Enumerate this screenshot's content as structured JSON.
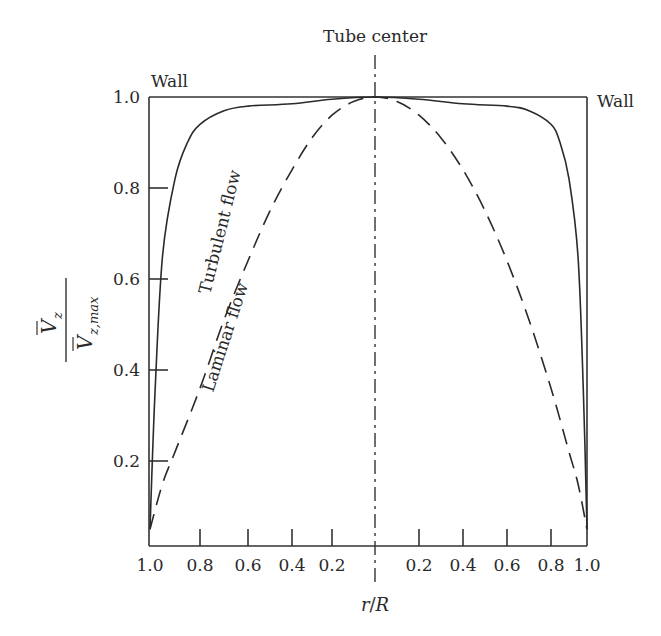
{
  "chart_data": {
    "type": "line",
    "title": "",
    "xlabel": "r/R",
    "ylabel": "V̄z / V̄z,max",
    "ylabel_numerator": "V",
    "ylabel_numerator_sub": "z",
    "ylabel_denominator": "V",
    "ylabel_denominator_sub": "z,max",
    "x_tick_labels_left": [
      "1.0",
      "0.8",
      "0.6",
      "0.4",
      "0.2"
    ],
    "x_tick_labels_right": [
      "0.2",
      "0.4",
      "0.6",
      "0.8",
      "1.0"
    ],
    "y_tick_labels": [
      "0.2",
      "0.4",
      "0.6",
      "0.8",
      "1.0"
    ],
    "ylim": [
      0,
      1.0
    ],
    "xlim_description": "symmetric about tube center: r/R from 1.0 (wall) to 0 (center) to 1.0 (wall)",
    "grid": false,
    "annotations": {
      "center_label": "Tube center",
      "wall_left": "Wall",
      "wall_right": "Wall"
    },
    "series": [
      {
        "name": "Turbulent flow",
        "style": "solid",
        "r_over_R": [
          1.0,
          0.98,
          0.95,
          0.9,
          0.85,
          0.8,
          0.7,
          0.6,
          0.4,
          0.2,
          0.0
        ],
        "values": [
          0.05,
          0.35,
          0.65,
          0.82,
          0.9,
          0.94,
          0.97,
          0.98,
          0.985,
          0.995,
          1.0
        ]
      },
      {
        "name": "Laminar flow",
        "style": "dashed",
        "r_over_R": [
          1.0,
          0.95,
          0.9,
          0.8,
          0.7,
          0.6,
          0.5,
          0.4,
          0.3,
          0.2,
          0.1,
          0.0
        ],
        "values": [
          0.05,
          0.15,
          0.22,
          0.36,
          0.51,
          0.64,
          0.75,
          0.84,
          0.91,
          0.96,
          0.99,
          1.0
        ]
      }
    ]
  },
  "labels": {
    "tube_center": "Tube center",
    "wall_left": "Wall",
    "wall_right": "Wall",
    "turbulent": "Turbulent flow",
    "laminar": "Laminar flow",
    "xlabel_r": "r",
    "xlabel_slash": "/",
    "xlabel_R": "R"
  }
}
